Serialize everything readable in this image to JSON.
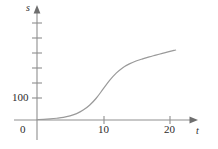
{
  "chart_data": {
    "type": "line",
    "title": "",
    "subtitle": "",
    "xlabel": "t",
    "ylabel": "s",
    "xlim": [
      -1.2,
      23.5
    ],
    "ylim": [
      -22,
      330
    ],
    "grid": false,
    "legend": null,
    "annotations": [],
    "x_ticks": [
      {
        "value": 10,
        "label": "10"
      },
      {
        "value": 20,
        "label": "20"
      }
    ],
    "y_ticks": [
      {
        "value": 100,
        "label": "100"
      },
      {
        "value": 50,
        "label": ""
      },
      {
        "value": 150,
        "label": ""
      },
      {
        "value": 200,
        "label": ""
      },
      {
        "value": 250,
        "label": ""
      },
      {
        "value": 300,
        "label": ""
      }
    ],
    "origin_label": "0",
    "series": [
      {
        "name": "s(t)",
        "color": "#9a9a9a",
        "x": [
          0,
          1,
          2,
          3,
          4,
          5,
          6,
          7,
          8,
          9,
          10,
          11,
          12,
          13,
          14,
          15,
          16,
          17,
          18,
          19,
          20,
          21
        ],
        "y": [
          2,
          3,
          5,
          8,
          12,
          19,
          29,
          45,
          68,
          100,
          140,
          180,
          213,
          238,
          255,
          268,
          278,
          287,
          295,
          303,
          311,
          318
        ]
      }
    ]
  },
  "labels": {
    "y_axis": "s",
    "x_axis": "t",
    "origin": "0",
    "y_tick_100": "100",
    "x_tick_10": "10",
    "x_tick_20": "20"
  },
  "colors": {
    "curve": "#9a9a9a",
    "axis": "#8f8f8f",
    "text": "#2b2b2b",
    "background": "#ffffff"
  }
}
